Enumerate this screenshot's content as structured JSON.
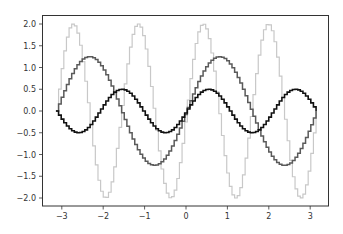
{
  "chart_data": {
    "type": "line",
    "drawstyle": "steps",
    "title": "",
    "xlabel": "",
    "ylabel": "",
    "xlim": [
      -3.45,
      3.45
    ],
    "ylim": [
      -2.2,
      2.2
    ],
    "grid": false,
    "legend": null,
    "xticks": [
      -3,
      -2,
      -1,
      0,
      1,
      2,
      3
    ],
    "xtick_labels": [
      "−3",
      "−2",
      "−1",
      "0",
      "1",
      "2",
      "3"
    ],
    "yticks": [
      2.0,
      1.5,
      1.0,
      0.5,
      0.0,
      -0.5,
      -1.0,
      -1.5,
      -2.0
    ],
    "ytick_labels": [
      "2.0",
      "1.5",
      "1.0",
      "0.5",
      "0.0",
      "−0.5",
      "−1.0",
      "−1.5",
      "−2.0"
    ],
    "x_range": [
      -3.14159,
      3.14159
    ],
    "num_points": 100,
    "series": [
      {
        "name": "2*sin(4x)",
        "amplitude": 2.0,
        "frequency": 4,
        "color": "#c8c8c8",
        "linewidth": 1.2
      },
      {
        "name": "1.25*sin(2x)",
        "amplitude": 1.25,
        "frequency": 2,
        "color": "#5a5a5a",
        "linewidth": 1.5
      },
      {
        "name": "0.5*sin(3x)",
        "amplitude": 0.5,
        "frequency": 3,
        "color": "#111111",
        "linewidth": 1.6
      }
    ]
  }
}
